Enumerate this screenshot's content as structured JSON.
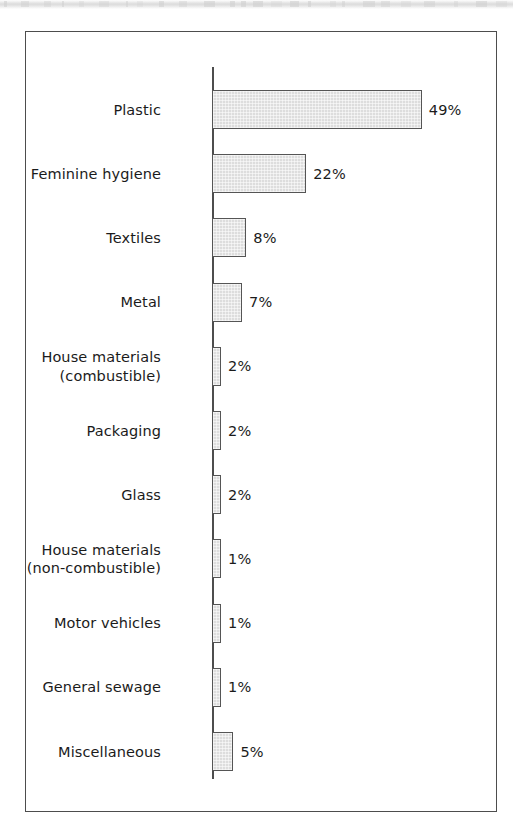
{
  "figure": {
    "frame": {
      "border_color": "#4d4d4d"
    },
    "axis": {
      "color": "#4d4d4d"
    },
    "bar_style": {
      "fill": "#dddddd",
      "stroke": "#555555"
    }
  },
  "chart_data": {
    "type": "bar",
    "orientation": "horizontal",
    "title": "",
    "subtitle": "",
    "xlabel": "",
    "ylabel": "",
    "grid": false,
    "legend": null,
    "axis": {
      "categorical_axis": "y",
      "value_axis": "x",
      "value_unit": "%"
    },
    "xlim": [
      0,
      49
    ],
    "categories": [
      "Plastic",
      "Feminine hygiene",
      "Textiles",
      "Metal",
      "House materials (combustible)",
      "Packaging",
      "Glass",
      "House materials (non-combustible)",
      "Motor vehicles",
      "General sewage",
      "Miscellaneous"
    ],
    "values": [
      49,
      22,
      8,
      7,
      2,
      2,
      2,
      1,
      1,
      1,
      5
    ],
    "data_labels": [
      "49%",
      "22%",
      "8%",
      "7%",
      "2%",
      "2%",
      "2%",
      "1%",
      "1%",
      "1%",
      "5%"
    ],
    "bars": [
      {
        "label_lines": [
          "Plastic"
        ],
        "value": 49,
        "data_label": "49%"
      },
      {
        "label_lines": [
          "Feminine hygiene"
        ],
        "value": 22,
        "data_label": "22%"
      },
      {
        "label_lines": [
          "Textiles"
        ],
        "value": 8,
        "data_label": "8%"
      },
      {
        "label_lines": [
          "Metal"
        ],
        "value": 7,
        "data_label": "7%"
      },
      {
        "label_lines": [
          "House materials",
          "(combustible)"
        ],
        "value": 2,
        "data_label": "2%"
      },
      {
        "label_lines": [
          "Packaging"
        ],
        "value": 2,
        "data_label": "2%"
      },
      {
        "label_lines": [
          "Glass"
        ],
        "value": 2,
        "data_label": "2%"
      },
      {
        "label_lines": [
          "House materials",
          "(non-combustible)"
        ],
        "value": 1,
        "data_label": "1%"
      },
      {
        "label_lines": [
          "Motor vehicles"
        ],
        "value": 1,
        "data_label": "1%"
      },
      {
        "label_lines": [
          "General sewage"
        ],
        "value": 1,
        "data_label": "1%"
      },
      {
        "label_lines": [
          "Miscellaneous"
        ],
        "value": 5,
        "data_label": "5%"
      }
    ]
  }
}
